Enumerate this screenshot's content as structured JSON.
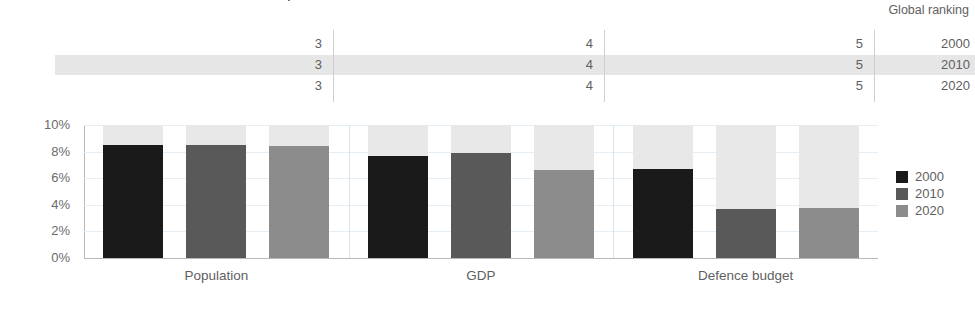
{
  "title": "CHINA'S SHARE OF GLOBAL POPULATION, GDP AND DEFENCE BUDGET",
  "ranking": {
    "header": "Global ranking",
    "years": [
      "2000",
      "2010",
      "2020"
    ],
    "highlighted_year": "2010",
    "values": {
      "Population": [
        "3",
        "3",
        "3"
      ],
      "GDP": [
        "4",
        "4",
        "4"
      ],
      "Defence budget": [
        "5",
        "5",
        "5"
      ]
    }
  },
  "legend": {
    "position": "right",
    "items": [
      {
        "label": "2000",
        "color": "#1a1a1a"
      },
      {
        "label": "2010",
        "color": "#595959"
      },
      {
        "label": "2020",
        "color": "#8c8c8c"
      }
    ]
  },
  "colors": {
    "series_2000": "#1a1a1a",
    "series_2010": "#595959",
    "series_2020": "#8c8c8c",
    "track": "#e8e8e8",
    "band": "#e6e6e6",
    "grid": "#e4eef4",
    "axis": "#b8b8b8"
  },
  "chart_data": {
    "type": "bar",
    "title": "CHINA'S SHARE OF GLOBAL POPULATION, GDP AND DEFENCE BUDGET",
    "xlabel": "",
    "ylabel": "",
    "categories": [
      "Population",
      "GDP",
      "Defence budget"
    ],
    "series": [
      {
        "name": "2000",
        "values": [
          8.5,
          7.7,
          6.7
        ]
      },
      {
        "name": "2010",
        "values": [
          8.5,
          7.9,
          3.7
        ]
      },
      {
        "name": "2020",
        "values": [
          8.4,
          6.6,
          3.75
        ]
      }
    ],
    "ylim": [
      0,
      10
    ],
    "yticks": [
      0,
      2,
      4,
      6,
      8,
      10
    ],
    "ytick_labels": [
      "0%",
      "2%",
      "4%",
      "6%",
      "8%",
      "10%"
    ],
    "grid": true,
    "legend_position": "right",
    "note": "Each bar is drawn inside a light-grey track representing the full 10% axis"
  }
}
